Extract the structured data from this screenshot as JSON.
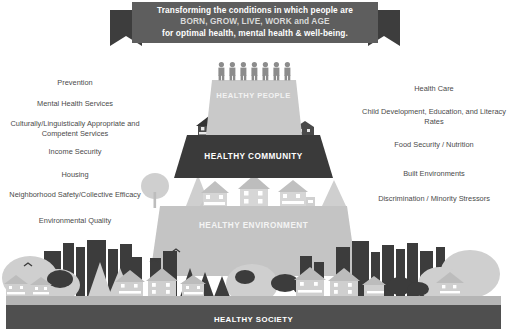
{
  "banner": {
    "line1": "Transforming the conditions in which people are",
    "line2": "BORN, GROW, LIVE, WORK and AGE",
    "line3": "for optimal health, mental health & well-being."
  },
  "left_labels": [
    "Prevention",
    "Mental Health Services",
    "Culturally/Linguistically Appropriate and Competent Services",
    "Income Security",
    "Housing",
    "Neighborhood Safety/Collective Efficacy",
    "Environmental Quality"
  ],
  "right_labels": [
    "Health Care",
    "Child Development, Education, and Literacy Rates",
    "Food Security / Nutrition",
    "Built Environments",
    "Discrimination / Minority Stressors"
  ],
  "pyramid": {
    "tier_people": "HEALTHY PEOPLE",
    "tier_community": "HEALTHY COMMUNITY",
    "tier_environment": "HEALTHY ENVIRONMENT",
    "base_society": "HEALTHY SOCIETY"
  },
  "colors": {
    "background": "#ffffff",
    "banner_fill": "#5e5e5e",
    "banner_tail": "#3d3d3d",
    "tier_people": "#c9c9c9",
    "tier_community": "#3a3a3a",
    "tier_environment": "#c4c4c4",
    "base_society": "#4f4f4f",
    "people_figures": "#8c8c8c",
    "skyline_dark": "#3c3c3c",
    "skyline_light": "#cfcfcf",
    "ground": "#b5b5b5",
    "label_text": "#4a4a4a"
  },
  "figure_counts": {
    "people_on_top": 7
  }
}
